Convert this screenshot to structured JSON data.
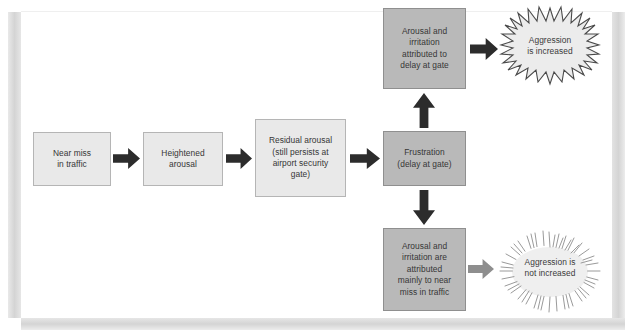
{
  "diagram": {
    "type": "flowchart",
    "nodes": [
      {
        "id": "near-miss",
        "label": "Near miss\nin traffic",
        "style": "light"
      },
      {
        "id": "heightened",
        "label": "Heightened\narousal",
        "style": "light"
      },
      {
        "id": "residual",
        "label": "Residual arousal\n(still persists at\nairport security\ngate)",
        "style": "light"
      },
      {
        "id": "frustration",
        "label": "Frustration\n(delay at gate)",
        "style": "dark"
      },
      {
        "id": "attr-gate",
        "label": "Arousal and\nirritation\nattributed to\ndelay at gate",
        "style": "dark"
      },
      {
        "id": "attr-traffic",
        "label": "Arousal and\nirritation are\nattributed\nmainly to near\nmiss in traffic",
        "style": "dark"
      }
    ],
    "outcomes": [
      {
        "id": "increased",
        "label": "Aggression\nis increased",
        "emphasis": "strong"
      },
      {
        "id": "not-increased",
        "label": "Aggression is\nnot increased",
        "emphasis": "weak"
      }
    ],
    "arrows": [
      {
        "id": "a1",
        "from": "near-miss",
        "to": "heightened",
        "direction": "right",
        "tone": "dark"
      },
      {
        "id": "a2",
        "from": "heightened",
        "to": "residual",
        "direction": "right",
        "tone": "dark"
      },
      {
        "id": "a3",
        "from": "residual",
        "to": "frustration",
        "direction": "right",
        "tone": "dark"
      },
      {
        "id": "a4",
        "from": "frustration",
        "to": "attr-gate",
        "direction": "up",
        "tone": "dark"
      },
      {
        "id": "a5",
        "from": "frustration",
        "to": "attr-traffic",
        "direction": "down",
        "tone": "dark"
      },
      {
        "id": "a6",
        "from": "attr-gate",
        "to": "increased",
        "direction": "right",
        "tone": "dark"
      },
      {
        "id": "a7",
        "from": "attr-traffic",
        "to": "not-increased",
        "direction": "right",
        "tone": "mid"
      }
    ],
    "colors": {
      "box_light_fill": "#e9e9e9",
      "box_dark_fill": "#b9b9b9",
      "box_border": "#8f8f8f",
      "arrow_dark": "#2c2c2c",
      "arrow_mid": "#8e8e8e",
      "burst_fill": "#ececec",
      "text": "#363636",
      "page_bar": "#d8d8d8"
    }
  }
}
